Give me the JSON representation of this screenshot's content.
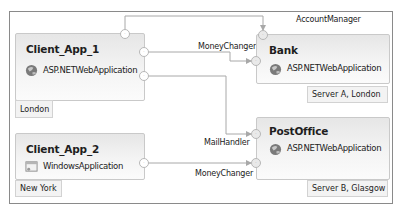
{
  "diagram": {
    "nodes": [
      {
        "id": "client_app_1",
        "title": "Client_App_1",
        "type": "ASP.NETWebApplication",
        "icon": "globe-icon",
        "location": "London"
      },
      {
        "id": "client_app_2",
        "title": "Client_App_2",
        "type": "WindowsApplication",
        "icon": "window-app-icon",
        "location": "New York"
      },
      {
        "id": "bank",
        "title": "Bank",
        "type": "ASP.NETWebApplication",
        "icon": "globe-icon",
        "location": "Server A, London"
      },
      {
        "id": "postoffice",
        "title": "PostOffice",
        "type": "ASP.NETWebApplication",
        "icon": "globe-icon",
        "location": "Server B, Glasgow"
      }
    ],
    "edges": [
      {
        "from": "client_app_1",
        "to": "bank",
        "label": "AccountManager"
      },
      {
        "from": "client_app_1",
        "to": "bank",
        "label": "MoneyChanger"
      },
      {
        "from": "client_app_1",
        "to": "postoffice",
        "label": "MailHandler"
      },
      {
        "from": "client_app_2",
        "to": "postoffice",
        "label": "MoneyChanger"
      }
    ],
    "port_glyph": "·",
    "colors": {
      "frame_border": "#8a8a8a",
      "node_border": "#c9c9c9",
      "wire": "#a8a8a8",
      "tag_bg": "#f3f3f3"
    }
  }
}
